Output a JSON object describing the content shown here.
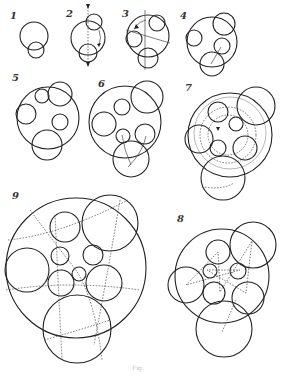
{
  "figure": {
    "caption": "Fig.",
    "panels": [
      {
        "label": "1",
        "x": 10,
        "y": 10
      },
      {
        "label": "2",
        "x": 66,
        "y": 8
      },
      {
        "label": "3",
        "x": 122,
        "y": 8
      },
      {
        "label": "4",
        "x": 180,
        "y": 10
      },
      {
        "label": "5",
        "x": 12,
        "y": 72
      },
      {
        "label": "6",
        "x": 98,
        "y": 78
      },
      {
        "label": "7",
        "x": 185,
        "y": 82
      },
      {
        "label": "9",
        "x": 12,
        "y": 190
      },
      {
        "label": "8",
        "x": 177,
        "y": 213
      }
    ]
  }
}
